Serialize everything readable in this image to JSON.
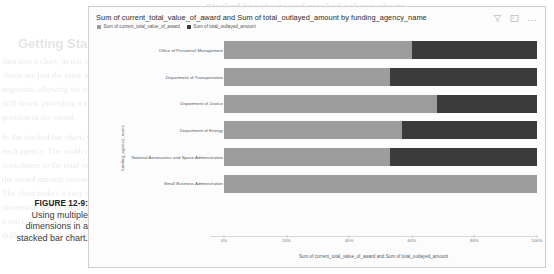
{
  "caption": {
    "label": "FIGURE 12-9:",
    "text": "Using multiple dimensions in a stacked bar chart."
  },
  "page_bleed": {
    "heading_top": "Stacked bar charts and stacked column charts",
    "heading_mid": "Getting Started with charts and stacked column ch",
    "lines": [
      "data into a chart, in this case, either a stacked",
      "charts are just the same as bar and column chart",
      "segments, allowing for multiple dimensions. The",
      "drill down, providing a visual breakdown of a sha",
      "position in the visual.",
      "In the stacked bar chart, you can see how each",
      "each agency. The width of each bar segment sho",
      "contributes to the total value of the bar. For exa",
      "the award amount versus the outlayed amount as",
      "The chart makes it easy to compare categories ac",
      "dimension and to see the proportion of each seg",
      "a stacked layout that stays readable even as the",
      "drills into more detail, the opportunity to sh"
    ]
  },
  "card": {
    "title": "Sum of current_total_value_of_award and Sum of total_outlayed_amount by funding_agency_name",
    "tools": [
      {
        "name": "filter-icon",
        "glyph": "filter"
      },
      {
        "name": "focus-mode-icon",
        "glyph": "focus"
      },
      {
        "name": "more-options-icon",
        "glyph": "..."
      }
    ]
  },
  "colors": {
    "series_1": "#9c9c9c",
    "series_2": "#3b3b3b",
    "card_bg": "#fcfcfc",
    "card_border": "#cfcfcf",
    "axis_line": "#d8d8d8",
    "text": "#555555"
  },
  "chart_data": {
    "type": "bar",
    "orientation": "horizontal",
    "stacked": true,
    "normalized": true,
    "title": "Sum of current_total_value_of_award and Sum of total_outlayed_amount by funding_agency_name",
    "xlabel": "Sum of current_total_value_of_award and Sum of total_outlayed_amount",
    "ylabel": "funding_agency_name",
    "xlim": [
      0,
      100
    ],
    "xticks": [
      "0%",
      "20%",
      "40%",
      "60%",
      "80%",
      "100%"
    ],
    "xtick_values": [
      0,
      20,
      40,
      60,
      80,
      100
    ],
    "grid": false,
    "legend_position": "top-left",
    "categories": [
      "Office of Personnel Management",
      "Department of Transportation",
      "Department of Justice",
      "Department of Energy",
      "National Aeronautics and Space Administration",
      "Small Business Administration"
    ],
    "series": [
      {
        "name": "Sum of current_total_value_of_award",
        "color": "#9c9c9c",
        "values": [
          60,
          53,
          68,
          57,
          53,
          100
        ]
      },
      {
        "name": "Sum of total_outlayed_amount",
        "color": "#3b3b3b",
        "values": [
          40,
          47,
          32,
          43,
          47,
          0
        ]
      }
    ]
  }
}
